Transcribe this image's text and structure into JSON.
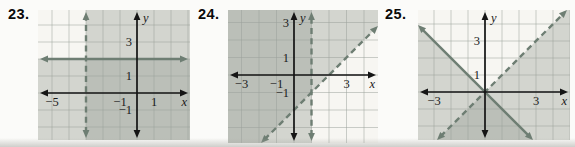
{
  "page": {
    "background": "#fbfbf9"
  },
  "colors": {
    "plot_bg": "#f7f6f2",
    "shade": "#8c968c",
    "shade_opacity": 0.34,
    "line": "#6e7e73",
    "grid": "#99a099",
    "axis": "#151515",
    "label": "#1a1a1a",
    "number": "#0a0a0a"
  },
  "chart_data": [
    {
      "type": "region-plot",
      "problem_number": "23.",
      "position": {
        "left": 38,
        "top": 10,
        "width": 152,
        "height": 130
      },
      "origin_px": {
        "x": 99,
        "y": 83
      },
      "unit_px": 17,
      "boundary_lines": [
        {
          "equation": "x = -3",
          "orientation": "vertical",
          "value": -3,
          "style": "dashed",
          "shade_side": "right"
        },
        {
          "equation": "y = 2",
          "orientation": "horizontal",
          "value": 2,
          "style": "solid",
          "shade_side": "below"
        }
      ],
      "x_tick_labels": [
        {
          "value": -5,
          "label": "−5"
        },
        {
          "value": -1,
          "label": "−1"
        },
        {
          "value": 1,
          "label": "1"
        }
      ],
      "y_tick_labels": [
        {
          "value": 3,
          "label": "3"
        },
        {
          "value": 1,
          "label": "1"
        },
        {
          "value": -1,
          "label": "−1"
        }
      ],
      "axis_labels": {
        "x": "x",
        "y": "y"
      },
      "shading_note": "region right of dashed line and region below solid line; overlap darker"
    },
    {
      "type": "region-plot",
      "problem_number": "24.",
      "position": {
        "left": 228,
        "top": 10,
        "width": 150,
        "height": 133
      },
      "origin_px": {
        "x": 66,
        "y": 65
      },
      "unit_px": 17.5,
      "boundary_lines": [
        {
          "equation": "x = 1",
          "orientation": "vertical",
          "value": 1,
          "style": "dashed",
          "shade_side": "left"
        },
        {
          "equation": "y = x - 2",
          "orientation": "diagonal",
          "slope": 1,
          "intercept": -2,
          "style": "dashed",
          "shade_side": "above"
        }
      ],
      "x_tick_labels": [
        {
          "value": -3,
          "label": "−3"
        },
        {
          "value": -1,
          "label": "−1"
        },
        {
          "value": 3,
          "label": "3"
        }
      ],
      "y_tick_labels": [
        {
          "value": 3,
          "label": "3"
        },
        {
          "value": 1,
          "label": "1"
        },
        {
          "value": -1,
          "label": "−1"
        }
      ],
      "axis_labels": {
        "x": "x",
        "y": "y"
      },
      "shading_note": "region left of vertical dashed line and region above diagonal dashed line; overlap darker"
    },
    {
      "type": "region-plot",
      "problem_number": "25.",
      "position": {
        "left": 418,
        "top": 10,
        "width": 152,
        "height": 130
      },
      "origin_px": {
        "x": 67,
        "y": 82
      },
      "unit_px": 17,
      "boundary_lines": [
        {
          "equation": "y = -x",
          "orientation": "diagonal",
          "slope": -1,
          "intercept": 0,
          "style": "solid",
          "shade_side": "below"
        },
        {
          "equation": "y = x",
          "orientation": "diagonal",
          "slope": 1,
          "intercept": 0,
          "style": "dashed",
          "shade_side": "below"
        }
      ],
      "x_tick_labels": [
        {
          "value": -3,
          "label": "−3"
        },
        {
          "value": 3,
          "label": "3"
        }
      ],
      "y_tick_labels": [
        {
          "value": 3,
          "label": "3"
        },
        {
          "value": 1,
          "label": "1"
        }
      ],
      "axis_labels": {
        "x": "x",
        "y": "y"
      },
      "shading_note": "region below solid line and region below dashed line; bottom overlap darker"
    }
  ]
}
